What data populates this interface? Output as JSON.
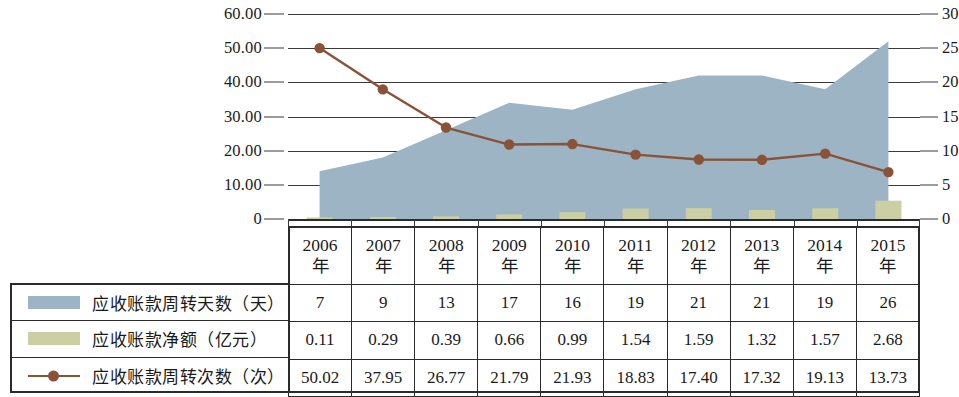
{
  "chart_data": {
    "type": "area",
    "title": "",
    "xlabel": "",
    "ylabel_left": "",
    "ylabel_right": "",
    "categories": [
      "2006年",
      "2007年",
      "2008年",
      "2009年",
      "2010年",
      "2011年",
      "2012年",
      "2013年",
      "2014年",
      "2015年"
    ],
    "year_numbers": [
      "2006",
      "2007",
      "2008",
      "2009",
      "2010",
      "2011",
      "2012",
      "2013",
      "2014",
      "2015"
    ],
    "year_suffix": "年",
    "left_axis": {
      "ticks": [
        "0",
        "10.00",
        "20.00",
        "30.00",
        "40.00",
        "50.00",
        "60.00"
      ],
      "values": [
        0,
        10,
        20,
        30,
        40,
        50,
        60
      ],
      "min": 0,
      "max": 60
    },
    "right_axis": {
      "ticks": [
        "0",
        "5",
        "10",
        "15",
        "20",
        "25",
        "30"
      ],
      "values": [
        0,
        5,
        10,
        15,
        20,
        25,
        30
      ],
      "min": 0,
      "max": 30
    },
    "grid": true,
    "legend_position": "table-left",
    "series": [
      {
        "name": "应收账款周转天数（天）",
        "type": "area",
        "axis": "right",
        "color": "#9db4c4",
        "values": [
          7,
          9,
          13,
          17,
          16,
          19,
          21,
          21,
          19,
          26
        ],
        "display": [
          "7",
          "9",
          "13",
          "17",
          "16",
          "19",
          "21",
          "21",
          "19",
          "26"
        ]
      },
      {
        "name": "应收账款净额（亿元）",
        "type": "bar",
        "axis": "right",
        "color": "#ccceA4",
        "values": [
          0.11,
          0.29,
          0.39,
          0.66,
          0.99,
          1.54,
          1.59,
          1.32,
          1.57,
          2.68
        ],
        "display": [
          "0.11",
          "0.29",
          "0.39",
          "0.66",
          "0.99",
          "1.54",
          "1.59",
          "1.32",
          "1.57",
          "2.68"
        ]
      },
      {
        "name": "应收账款周转次数（次）",
        "type": "line",
        "axis": "left",
        "color": "#8a5236",
        "values": [
          50.02,
          37.95,
          26.77,
          21.79,
          21.93,
          18.83,
          17.4,
          17.32,
          19.13,
          13.73
        ],
        "display": [
          "50.02",
          "37.95",
          "26.77",
          "21.79",
          "21.93",
          "18.83",
          "17.40",
          "17.32",
          "19.13",
          "13.73"
        ]
      }
    ]
  },
  "colors": {
    "area_fill": "#9db4c4",
    "bar_fill": "#ccceA4",
    "line": "#8a5236",
    "grid": "#3a3a3a",
    "text": "#1a1a1a"
  }
}
